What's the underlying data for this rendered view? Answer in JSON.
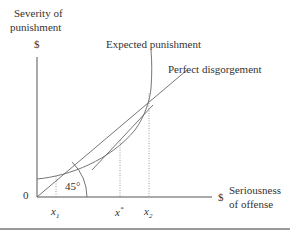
{
  "diagram": {
    "y_axis_label_line1": "Severity of",
    "y_axis_label_line2": "punishment",
    "y_axis_unit": "$",
    "x_axis_unit": "$",
    "x_axis_label_line1": "Seriousness",
    "x_axis_label_line2": "of offense",
    "origin": "0",
    "angle_label": "45°",
    "curves": {
      "expected_punishment": "Expected punishment",
      "perfect_disgorgement": "Perfect disgorgement"
    },
    "x_ticks": {
      "x1": "x",
      "x1_sub": "1",
      "xstar": "x",
      "xstar_sup": "*",
      "x2": "x",
      "x2_sub": "2"
    },
    "colors": {
      "line": "#555555",
      "text": "#333333",
      "rule": "#999999"
    }
  }
}
